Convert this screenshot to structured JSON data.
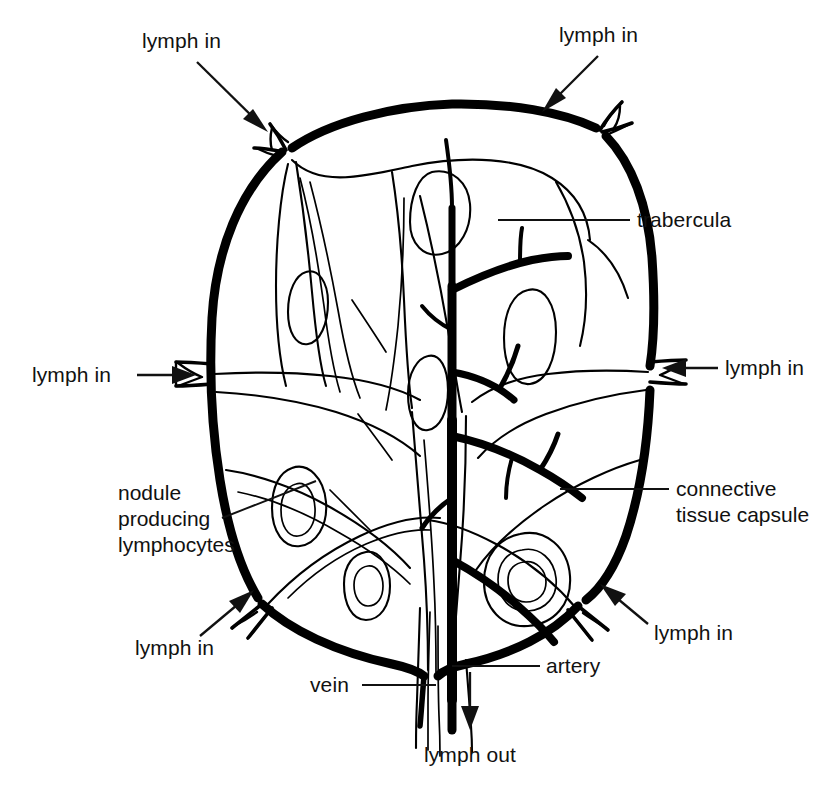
{
  "figure": {
    "background_color": "#ffffff",
    "ink_color": "#111111",
    "width": 836,
    "height": 787
  },
  "labels": {
    "lymph_in_top_left": "lymph in",
    "lymph_in_top_right": "lymph in",
    "lymph_in_left": "lymph in",
    "lymph_in_right": "lymph in",
    "lymph_in_bottom_left": "lymph in",
    "lymph_in_bottom_right": "lymph in",
    "trabercula": "trabercula",
    "connective_tissue_capsule_line1": "connective",
    "connective_tissue_capsule_line2": "tissue capsule",
    "nodule_line1": "nodule",
    "nodule_line2": "producing",
    "nodule_line3": "lymphocytes",
    "vein": "vein",
    "artery": "artery",
    "lymph_out": "lymph out"
  },
  "structures": {
    "capsule": "connective tissue capsule",
    "trabeculae": "trabercula",
    "nodules": "nodule producing lymphocytes",
    "artery": "artery",
    "vein": "vein",
    "afferent_vessels_count": 6,
    "efferent_vessel": "lymph out",
    "germinal_centers_count": 8
  }
}
